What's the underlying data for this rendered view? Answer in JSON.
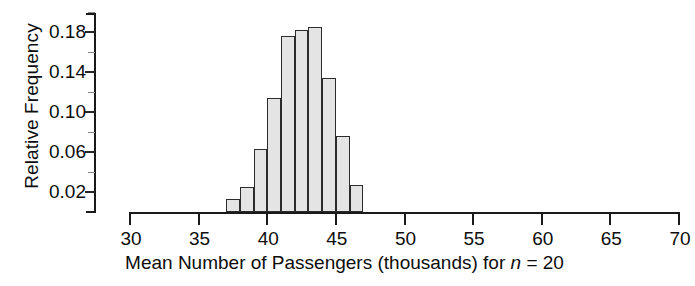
{
  "chart_data": {
    "type": "bar",
    "title": "",
    "subtitle": "",
    "xlabel_parts": {
      "before": "Mean Number of Passengers (thousands) for ",
      "italic": "n",
      "after": " = 20"
    },
    "xlabel": "Mean Number of Passengers (thousands) for n = 20",
    "ylabel": "Relative Frequency",
    "xlim": [
      30,
      70
    ],
    "ylim": [
      0,
      0.2
    ],
    "grid": false,
    "legend": null,
    "xticks": [
      30,
      35,
      40,
      45,
      50,
      55,
      60,
      65,
      70
    ],
    "xtick_labels": [
      "30",
      "35",
      "40",
      "45",
      "50",
      "55",
      "60",
      "65",
      "70"
    ],
    "yticks": [
      0.02,
      0.06,
      0.1,
      0.14,
      0.18
    ],
    "ytick_labels": [
      "0.02",
      "0.06",
      "0.10",
      "0.14",
      "0.18"
    ],
    "yticks_minor": [
      0.04,
      0.08,
      0.12,
      0.16,
      0.2
    ],
    "bin_width": 1,
    "bins": [
      {
        "x0": 37,
        "x1": 38,
        "value": 0.013
      },
      {
        "x0": 38,
        "x1": 39,
        "value": 0.025
      },
      {
        "x0": 39,
        "x1": 40,
        "value": 0.063
      },
      {
        "x0": 40,
        "x1": 41,
        "value": 0.114
      },
      {
        "x0": 41,
        "x1": 42,
        "value": 0.176
      },
      {
        "x0": 42,
        "x1": 43,
        "value": 0.182
      },
      {
        "x0": 43,
        "x1": 44,
        "value": 0.185
      },
      {
        "x0": 44,
        "x1": 45,
        "value": 0.134
      },
      {
        "x0": 45,
        "x1": 46,
        "value": 0.076
      },
      {
        "x0": 46,
        "x1": 47,
        "value": 0.027
      }
    ],
    "categories": [
      "37-38",
      "38-39",
      "39-40",
      "40-41",
      "41-42",
      "42-43",
      "43-44",
      "44-45",
      "45-46",
      "46-47"
    ],
    "values": [
      0.013,
      0.025,
      0.063,
      0.114,
      0.176,
      0.182,
      0.185,
      0.134,
      0.076,
      0.027
    ],
    "colors": {
      "bar_fill": "#e4e4e4",
      "bar_edge": "#2b2b2b",
      "axis": "#1a1a1a",
      "text": "#0d0d0d",
      "background": "#ffffff"
    }
  }
}
